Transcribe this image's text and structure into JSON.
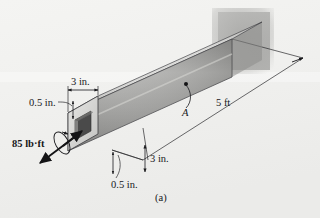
{
  "figure": {
    "caption": "(a)",
    "background_color": "#f2f2f0"
  },
  "labels": {
    "width_top": "3 in.",
    "wall_thickness_top": "0.5 in.",
    "torque": "85 lb·ft",
    "point_a": "A",
    "length": "5 ft",
    "height_side": "3 in.",
    "wall_thickness_bottom": "0.5 in."
  },
  "colors": {
    "beam_top_face_light": "#e8e8e6",
    "beam_top_face_dark": "#b8b8b6",
    "beam_side_face_light": "#d6d6d4",
    "beam_side_face_dark": "#8f8f8d",
    "beam_end_face": "#dcdcda",
    "cavity": "#4a4a4a",
    "wall": "#b0b0ae",
    "line": "#1b1b1e",
    "text": "#17171a"
  },
  "bleed_text": [
    "—",
    "—",
    "—"
  ]
}
